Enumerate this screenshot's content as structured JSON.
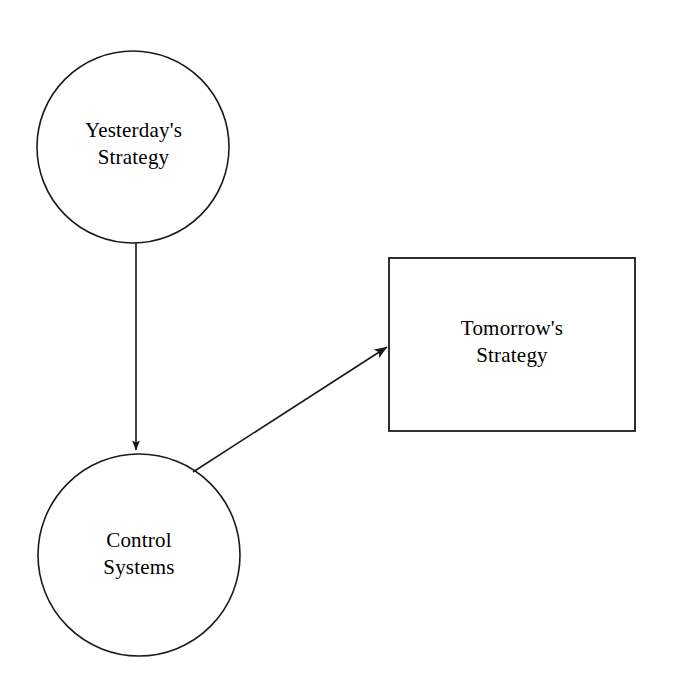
{
  "diagram": {
    "background_color": "#ffffff",
    "stroke_color": "#1a1a1a",
    "text_color": "#000000",
    "nodes": [
      {
        "id": "yesterdays-strategy",
        "shape": "circle",
        "label": "Yesterday's\nStrategy",
        "line1": "Yesterday's",
        "line2": "Strategy",
        "cx": 133,
        "cy": 147,
        "r": 96
      },
      {
        "id": "control-systems",
        "shape": "circle",
        "label": "Control\nSystems",
        "line1": "Control",
        "line2": "Systems",
        "cx": 139,
        "cy": 555,
        "r": 101
      },
      {
        "id": "tomorrows-strategy",
        "shape": "rectangle",
        "label": "Tomorrow's\nStrategy",
        "line1": "Tomorrow's",
        "line2": "Strategy",
        "x": 389,
        "y": 258,
        "width": 246,
        "height": 173
      }
    ],
    "edges": [
      {
        "id": "yesterday-to-control",
        "from": "yesterdays-strategy",
        "to": "control-systems",
        "type": "straight-arrow",
        "direction": "down",
        "label": ""
      },
      {
        "id": "control-to-tomorrow",
        "from": "control-systems",
        "to": "tomorrows-strategy",
        "type": "straight-arrow",
        "direction": "up-right",
        "label": ""
      }
    ]
  }
}
